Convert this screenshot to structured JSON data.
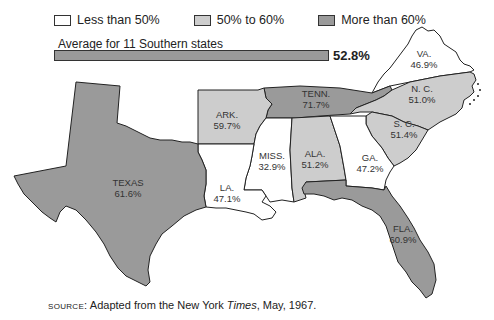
{
  "title_fragment": "",
  "legend": {
    "items": [
      {
        "label": "Less than 50%",
        "color": "#ffffff"
      },
      {
        "label": "50% to 60%",
        "color": "#cdcdcd"
      },
      {
        "label": "More than 60%",
        "color": "#9a9a9a"
      }
    ]
  },
  "average": {
    "label": "Average for 11 Southern states",
    "value": "52.8%",
    "color": "#9a9a9a"
  },
  "states": [
    {
      "abbr": "VA.",
      "value": "46.9%",
      "category": "Less than 50%",
      "color": "#ffffff"
    },
    {
      "abbr": "N. C.",
      "value": "51.0%",
      "category": "50% to 60%",
      "color": "#cdcdcd"
    },
    {
      "abbr": "TENN.",
      "value": "71.7%",
      "category": "More than 60%",
      "color": "#9a9a9a"
    },
    {
      "abbr": "ARK.",
      "value": "59.7%",
      "category": "50% to 60%",
      "color": "#cdcdcd"
    },
    {
      "abbr": "S. C.",
      "value": "51.4%",
      "category": "50% to 60%",
      "color": "#cdcdcd"
    },
    {
      "abbr": "MISS.",
      "value": "32.9%",
      "category": "Less than 50%",
      "color": "#ffffff"
    },
    {
      "abbr": "ALA.",
      "value": "51.2%",
      "category": "50% to 60%",
      "color": "#cdcdcd"
    },
    {
      "abbr": "GA.",
      "value": "47.2%",
      "category": "Less than 50%",
      "color": "#ffffff"
    },
    {
      "abbr": "TEXAS",
      "value": "61.6%",
      "category": "More than 60%",
      "color": "#9a9a9a"
    },
    {
      "abbr": "LA.",
      "value": "47.1%",
      "category": "Less than 50%",
      "color": "#ffffff"
    },
    {
      "abbr": "FLA.",
      "value": "60.9%",
      "category": "More than 60%",
      "color": "#9a9a9a"
    }
  ],
  "source": {
    "prefix": "SOURCE:",
    "text_before": " Adapted from the New York ",
    "italic": "Times",
    "text_after": ", May, 1967."
  }
}
